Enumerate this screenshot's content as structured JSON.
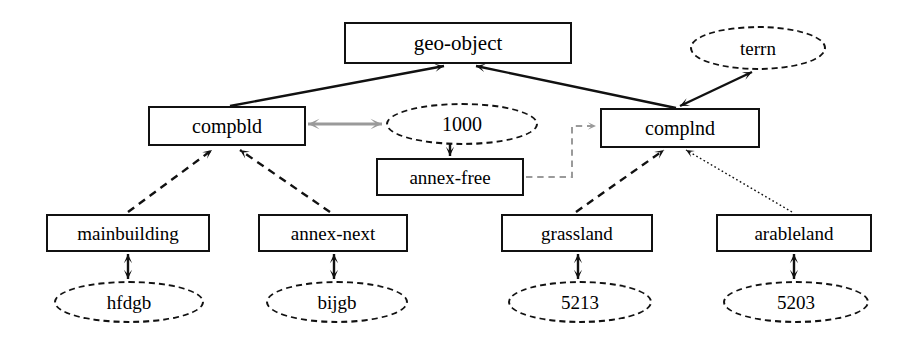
{
  "diagram": {
    "background_color": "#ffffff",
    "stroke_color": "#111111",
    "gray_arrow_color": "#9a9a9a",
    "nodes": [
      {
        "id": "geo-object",
        "label": "geo-object",
        "shape": "box",
        "x": 344,
        "y": 22,
        "w": 228,
        "h": 42,
        "font_size": 21
      },
      {
        "id": "terrn",
        "label": "terrn",
        "shape": "ellipse",
        "x": 690,
        "y": 26,
        "w": 136,
        "h": 44,
        "font_size": 19
      },
      {
        "id": "compbld",
        "label": "compbld",
        "shape": "box",
        "x": 148,
        "y": 106,
        "w": 158,
        "h": 40,
        "font_size": 20
      },
      {
        "id": "1000",
        "label": "1000",
        "shape": "ellipse",
        "x": 386,
        "y": 103,
        "w": 152,
        "h": 42,
        "font_size": 20
      },
      {
        "id": "complnd",
        "label": "complnd",
        "shape": "box",
        "x": 600,
        "y": 108,
        "w": 160,
        "h": 40,
        "font_size": 20
      },
      {
        "id": "annex-free",
        "label": "annex-free",
        "shape": "box",
        "x": 376,
        "y": 158,
        "w": 148,
        "h": 38,
        "font_size": 19
      },
      {
        "id": "mainbuilding",
        "label": "mainbuilding",
        "shape": "box",
        "x": 46,
        "y": 214,
        "w": 164,
        "h": 38,
        "font_size": 19
      },
      {
        "id": "annex-next",
        "label": "annex-next",
        "shape": "box",
        "x": 258,
        "y": 214,
        "w": 150,
        "h": 38,
        "font_size": 19
      },
      {
        "id": "grassland",
        "label": "grassland",
        "shape": "box",
        "x": 501,
        "y": 214,
        "w": 152,
        "h": 38,
        "font_size": 19
      },
      {
        "id": "arableland",
        "label": "arableland",
        "shape": "box",
        "x": 716,
        "y": 214,
        "w": 156,
        "h": 38,
        "font_size": 19
      },
      {
        "id": "hfdgb",
        "label": "hfdgb",
        "shape": "ellipse",
        "x": 54,
        "y": 281,
        "w": 150,
        "h": 42,
        "font_size": 19
      },
      {
        "id": "bijgb",
        "label": "bijgb",
        "shape": "ellipse",
        "x": 266,
        "y": 281,
        "w": 142,
        "h": 42,
        "font_size": 19
      },
      {
        "id": "5213",
        "label": "5213",
        "shape": "ellipse",
        "x": 508,
        "y": 281,
        "w": 144,
        "h": 42,
        "font_size": 19
      },
      {
        "id": "5203",
        "label": "5203",
        "shape": "ellipse",
        "x": 723,
        "y": 281,
        "w": 146,
        "h": 42,
        "font_size": 19
      }
    ],
    "edges": [
      {
        "id": "compbld-to-geo-object",
        "from": "compbld",
        "to": "geo-object",
        "style": "solid",
        "arrow": "end",
        "width": 2.4
      },
      {
        "id": "complnd-to-geo-object",
        "from": "complnd",
        "to": "geo-object",
        "style": "solid",
        "arrow": "end",
        "width": 2.4
      },
      {
        "id": "complnd-to-terrn",
        "from": "complnd",
        "to": "terrn",
        "style": "solid",
        "arrow": "both",
        "width": 2.4
      },
      {
        "id": "compbld-to-1000",
        "from": "compbld",
        "to": "1000",
        "style": "solid",
        "arrow": "both",
        "width": 3,
        "color": "gray"
      },
      {
        "id": "annex-free-to-1000",
        "from": "annex-free",
        "to": "1000",
        "style": "solid",
        "arrow": "both",
        "width": 2.4
      },
      {
        "id": "annex-free-to-complnd",
        "from": "annex-free",
        "to": "complnd",
        "style": "dashed",
        "arrow": "end",
        "width": 2,
        "color": "gray"
      },
      {
        "id": "mainbuilding-to-compbld",
        "from": "mainbuilding",
        "to": "compbld",
        "style": "dashed",
        "arrow": "end",
        "width": 2.4
      },
      {
        "id": "annex-next-to-compbld",
        "from": "annex-next",
        "to": "compbld",
        "style": "dashed",
        "arrow": "end",
        "width": 2.4
      },
      {
        "id": "grassland-to-complnd",
        "from": "grassland",
        "to": "complnd",
        "style": "dashed",
        "arrow": "end",
        "width": 2.4
      },
      {
        "id": "arableland-to-complnd",
        "from": "arableland",
        "to": "complnd",
        "style": "dotted",
        "arrow": "end",
        "width": 1.4
      },
      {
        "id": "mainbuilding-to-hfdgb",
        "from": "mainbuilding",
        "to": "hfdgb",
        "style": "solid",
        "arrow": "both",
        "width": 2.4
      },
      {
        "id": "annex-next-to-bijgb",
        "from": "annex-next",
        "to": "bijgb",
        "style": "solid",
        "arrow": "both",
        "width": 2.4
      },
      {
        "id": "grassland-to-5213",
        "from": "grassland",
        "to": "5213",
        "style": "solid",
        "arrow": "both",
        "width": 2.4
      },
      {
        "id": "arableland-to-5203",
        "from": "arableland",
        "to": "5203",
        "style": "solid",
        "arrow": "both",
        "width": 2.4
      }
    ],
    "edge_paths": {
      "compbld-to-geo-object": [
        [
          230,
          106
        ],
        [
          444,
          66
        ]
      ],
      "complnd-to-geo-object": [
        [
          676,
          108
        ],
        [
          476,
          66
        ]
      ],
      "complnd-to-terrn": [
        [
          680,
          106
        ],
        [
          752,
          72
        ]
      ],
      "compbld-to-1000": [
        [
          308,
          124
        ],
        [
          382,
          124
        ]
      ],
      "annex-free-to-1000": [
        [
          450,
          156
        ],
        [
          450,
          130
        ]
      ],
      "annex-free-to-complnd": [
        [
          526,
          177
        ],
        [
          572,
          177
        ],
        [
          572,
          126
        ],
        [
          596,
          126
        ]
      ],
      "mainbuilding-to-compbld": [
        [
          128,
          212
        ],
        [
          212,
          150
        ]
      ],
      "annex-next-to-compbld": [
        [
          330,
          212
        ],
        [
          240,
          150
        ]
      ],
      "grassland-to-complnd": [
        [
          576,
          212
        ],
        [
          664,
          150
        ]
      ],
      "arableland-to-complnd": [
        [
          792,
          212
        ],
        [
          686,
          150
        ]
      ],
      "mainbuilding-to-hfdgb": [
        [
          128,
          254
        ],
        [
          128,
          279
        ]
      ],
      "annex-next-to-bijgb": [
        [
          334,
          254
        ],
        [
          334,
          279
        ]
      ],
      "grassland-to-5213": [
        [
          578,
          254
        ],
        [
          578,
          279
        ]
      ],
      "arableland-to-5203": [
        [
          794,
          254
        ],
        [
          794,
          279
        ]
      ]
    }
  }
}
